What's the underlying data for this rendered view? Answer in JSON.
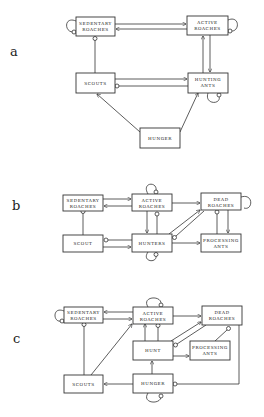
{
  "panels": [
    {
      "label": "a",
      "nodes": {
        "sedentary": [
          "SEDENTARY",
          "ROACHES"
        ],
        "active": [
          "ACTIVE",
          "ROACHES"
        ],
        "scouts": [
          "SCOUTS"
        ],
        "hunting": [
          "HUNTING",
          "ANTS"
        ],
        "hunger": [
          "HUNGER"
        ]
      }
    },
    {
      "label": "b",
      "nodes": {
        "sedentary": [
          "SEDENTARY",
          "ROACHES"
        ],
        "active": [
          "ACTIVE",
          "ROACHES"
        ],
        "dead": [
          "DEAD",
          "ROACHES"
        ],
        "scout": [
          "SCOUT"
        ],
        "hunters": [
          "HUNTERS"
        ],
        "processing": [
          "PROCESSING",
          "ANTS"
        ]
      }
    },
    {
      "label": "c",
      "nodes": {
        "sedentary": [
          "SEDENTARY",
          "ROACHES"
        ],
        "active": [
          "ACTIVE",
          "ROACHES"
        ],
        "dead": [
          "DEAD",
          "ROACHES"
        ],
        "hunt": [
          "HUNT"
        ],
        "processing": [
          "PROCESSING",
          "ANTS"
        ],
        "scouts": [
          "SCOUTS"
        ],
        "hunger": [
          "HUNGER"
        ]
      }
    }
  ],
  "colors": {
    "line": "#333333",
    "text": "#222222",
    "background": "#ffffff"
  }
}
